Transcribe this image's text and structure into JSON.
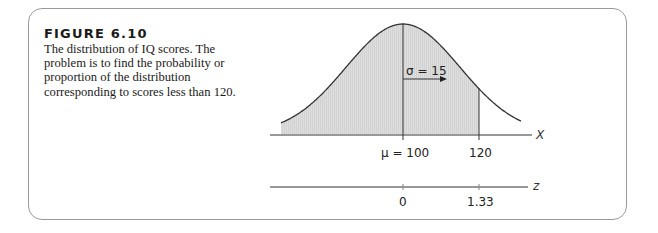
{
  "figure": {
    "label": "FIGURE 6.10",
    "caption": "The distribution of IQ scores. The problem is to find the probability or proportion of the distribution corresponding to scores less than 120."
  },
  "chart_data": {
    "type": "area",
    "title": "The distribution of IQ scores",
    "distribution": "normal",
    "mean": 100,
    "sd": 15,
    "shaded_region": {
      "from": "-inf",
      "to": 120
    },
    "x_axis": {
      "label": "X",
      "ticks": [
        {
          "value": 100,
          "label": "μ = 100"
        },
        {
          "value": 120,
          "label": "120"
        }
      ]
    },
    "z_axis": {
      "label": "z",
      "ticks": [
        {
          "value": 0,
          "label": "0"
        },
        {
          "value": 1.33,
          "label": "1.33"
        }
      ]
    },
    "annotations": [
      {
        "text": "σ = 15",
        "type": "arrow",
        "from": 100,
        "to": 115
      }
    ],
    "grid": false
  },
  "labels": {
    "sigma": "σ = 15",
    "mu_tick": "μ = 100",
    "x120_tick": "120",
    "x_axis_var": "X",
    "z0_tick": "0",
    "z133_tick": "1.33",
    "z_axis_var": "z"
  }
}
